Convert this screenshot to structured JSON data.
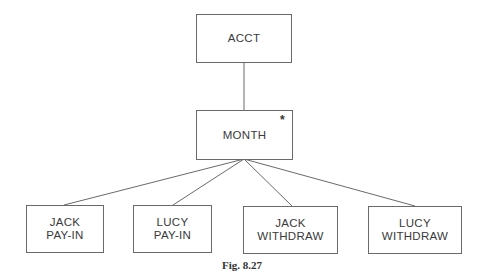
{
  "diagram": {
    "root": {
      "label": "ACCT"
    },
    "child": {
      "label": "MONTH",
      "marker": "*"
    },
    "leaves": [
      {
        "line1": "JACK",
        "line2": "PAY-IN"
      },
      {
        "line1": "LUCY",
        "line2": "PAY-IN"
      },
      {
        "line1": "JACK",
        "line2": "WITHDRAW"
      },
      {
        "line1": "LUCY",
        "line2": "WITHDRAW"
      }
    ],
    "caption": "Fig. 8.27",
    "colors": {
      "line": "#6a6a6a",
      "text": "#3a3a3a"
    }
  }
}
